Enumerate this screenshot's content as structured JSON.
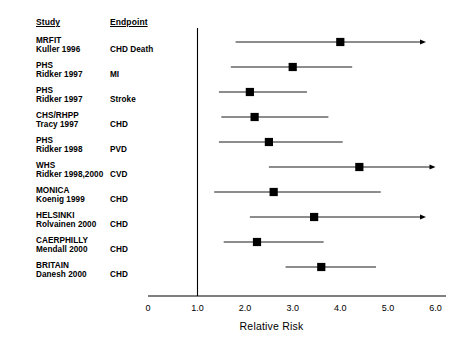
{
  "table": {
    "headers": {
      "study": "Study",
      "endpoint": "Endpoint"
    }
  },
  "axis": {
    "title": "Relative Risk",
    "ticks": [
      "0",
      "1.0",
      "2.0",
      "3.0",
      "4.0",
      "5.0",
      "6.0"
    ],
    "reference_value": "1.0"
  },
  "rows": [
    {
      "study": "MRFIT",
      "author": "Kuller 1996",
      "endpoint": "CHD Death"
    },
    {
      "study": "PHS",
      "author": "Ridker 1997",
      "endpoint": "MI"
    },
    {
      "study": "PHS",
      "author": "Ridker 1997",
      "endpoint": "Stroke"
    },
    {
      "study": "CHS/RHPP",
      "author": "Tracy 1997",
      "endpoint": "CHD"
    },
    {
      "study": "PHS",
      "author": "Ridker 1998",
      "endpoint": "PVD"
    },
    {
      "study": "WHS",
      "author": "Ridker 1998,2000",
      "endpoint": "CVD"
    },
    {
      "study": "MONICA",
      "author": "Koenig 1999",
      "endpoint": "CHD"
    },
    {
      "study": "HELSINKI",
      "author": "Rolvainen 2000",
      "endpoint": "CHD"
    },
    {
      "study": "CAERPHILLY",
      "author": "Mendall 2000",
      "endpoint": "CHD"
    },
    {
      "study": "BRITAIN",
      "author": "Danesh 2000",
      "endpoint": "CHD"
    }
  ],
  "chart_data": {
    "type": "scatter",
    "title": "",
    "xlabel": "Relative Risk",
    "ylabel": "",
    "xlim": [
      1.0,
      6.0
    ],
    "xticks": [
      0,
      1.0,
      2.0,
      3.0,
      4.0,
      5.0,
      6.0
    ],
    "grid": false,
    "legend": "none",
    "reference_line": 1.0,
    "categories": [
      "MRFIT Kuller 1996 CHD Death",
      "PHS Ridker 1997 MI",
      "PHS Ridker 1997 Stroke",
      "CHS/RHPP Tracy 1997 CHD",
      "PHS Ridker 1998 PVD",
      "WHS Ridker 1998,2000 CVD",
      "MONICA Koenig 1999 CHD",
      "HELSINKI Rolvainen 2000 CHD",
      "CAERPHILLY Mendall 2000 CHD",
      "BRITAIN Danesh 2000 CHD"
    ],
    "points": [
      {
        "label": "MRFIT Kuller 1996 CHD Death",
        "estimate": 4.0,
        "low": 1.8,
        "high": 5.8,
        "arrow_right": true
      },
      {
        "label": "PHS Ridker 1997 MI",
        "estimate": 3.0,
        "low": 1.7,
        "high": 4.25,
        "arrow_right": false
      },
      {
        "label": "PHS Ridker 1997 Stroke",
        "estimate": 2.1,
        "low": 1.45,
        "high": 3.3,
        "arrow_right": false
      },
      {
        "label": "CHS/RHPP Tracy 1997 CHD",
        "estimate": 2.2,
        "low": 1.5,
        "high": 3.75,
        "arrow_right": false
      },
      {
        "label": "PHS Ridker 1998 PVD",
        "estimate": 2.5,
        "low": 1.45,
        "high": 4.05,
        "arrow_right": false
      },
      {
        "label": "WHS Ridker 1998,2000 CVD",
        "estimate": 4.4,
        "low": 2.5,
        "high": 6.0,
        "arrow_right": true
      },
      {
        "label": "MONICA Koenig 1999 CHD",
        "estimate": 2.6,
        "low": 1.35,
        "high": 4.85,
        "arrow_right": false
      },
      {
        "label": "HELSINKI Rolvainen 2000 CHD",
        "estimate": 3.45,
        "low": 2.1,
        "high": 5.8,
        "arrow_right": true
      },
      {
        "label": "CAERPHILLY Mendall 2000 CHD",
        "estimate": 2.25,
        "low": 1.55,
        "high": 3.65,
        "arrow_right": false
      },
      {
        "label": "BRITAIN Danesh 2000 CHD",
        "estimate": 3.6,
        "low": 2.85,
        "high": 4.75,
        "arrow_right": false
      }
    ]
  },
  "colors": {
    "marker": "#000000",
    "line": "#000000",
    "axis": "#000000",
    "background": "#ffffff"
  }
}
